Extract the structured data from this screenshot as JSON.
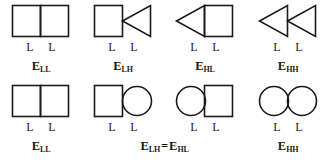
{
  "figure": {
    "name": "energy-state-shape-pairs-diagram",
    "stroke_color": "#1a1a1a",
    "background_color": "#ffffff",
    "rows": [
      {
        "id": "top-row",
        "cells": [
          {
            "id": "top-cell-1",
            "shape_left": "square",
            "shape_right": "square",
            "sublabel_left": "L",
            "sublabel_right": "L",
            "energy_base": "E",
            "energy_sub": "LL"
          },
          {
            "id": "top-cell-2",
            "shape_left": "square",
            "shape_right": "triangle-left",
            "sublabel_left": "L",
            "sublabel_right": "L",
            "energy_base": "E",
            "energy_sub": "LH"
          },
          {
            "id": "top-cell-3",
            "shape_left": "triangle-left",
            "shape_right": "square",
            "sublabel_left": "L",
            "sublabel_right": "L",
            "energy_base": "E",
            "energy_sub": "HL"
          },
          {
            "id": "top-cell-4",
            "shape_left": "triangle-left",
            "shape_right": "triangle-left",
            "sublabel_left": "L",
            "sublabel_right": "L",
            "energy_base": "E",
            "energy_sub": "HH"
          }
        ]
      },
      {
        "id": "bottom-row",
        "cells": [
          {
            "id": "bottom-cell-1",
            "shape_left": "square",
            "shape_right": "square",
            "sublabel_left": "L",
            "sublabel_right": "L",
            "energy_base": "E",
            "energy_sub": "LL"
          },
          {
            "id": "bottom-cell-2",
            "shape_left": "square",
            "shape_right": "circle",
            "sublabel_left": "L",
            "sublabel_right": "L",
            "energy_base": "",
            "energy_sub": ""
          },
          {
            "id": "bottom-cell-3",
            "shape_left": "circle",
            "shape_right": "square",
            "sublabel_left": "L",
            "sublabel_right": "L",
            "energy_base": "",
            "energy_sub": ""
          },
          {
            "id": "bottom-cell-4",
            "shape_left": "circle",
            "shape_right": "circle",
            "sublabel_left": "L",
            "sublabel_right": "L",
            "energy_base": "E",
            "energy_sub": "HH"
          }
        ],
        "spanning_label": {
          "left_base": "E",
          "left_sub": "LH",
          "equals": "=",
          "right_base": "E",
          "right_sub": "HL"
        }
      }
    ]
  }
}
